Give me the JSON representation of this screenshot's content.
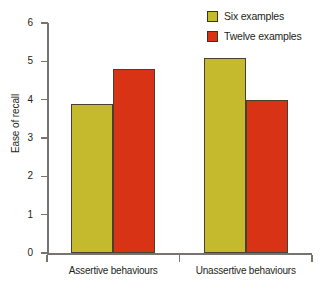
{
  "chart_data": {
    "type": "bar",
    "title": "",
    "subtitle": "",
    "xlabel": "",
    "ylabel": "Ease of recall",
    "categories": [
      "Assertive behaviours",
      "Unassertive behaviours"
    ],
    "series": [
      {
        "name": "Six examples",
        "values": [
          3.9,
          5.1
        ],
        "color": "#c5b92e"
      },
      {
        "name": "Twelve examples",
        "values": [
          4.8,
          4.0
        ],
        "color": "#d93316"
      }
    ],
    "ylim": [
      0,
      6
    ],
    "yticks": [
      0,
      1,
      2,
      3,
      4,
      5,
      6
    ],
    "ytick_labels": [
      "0",
      "1",
      "2",
      "3",
      "4",
      "5",
      "6"
    ],
    "grid": false,
    "legend_position": "top-right",
    "axis_color": "#77736d",
    "bar_outline_color": "#4a4030",
    "text_color": "#231f20"
  },
  "legend": {
    "items": [
      {
        "label": "Six examples",
        "swatch_name": "legend-swatch-six-examples"
      },
      {
        "label": "Twelve examples",
        "swatch_name": "legend-swatch-twelve-examples"
      }
    ]
  },
  "axes": {
    "y_title": "Ease of recall"
  }
}
